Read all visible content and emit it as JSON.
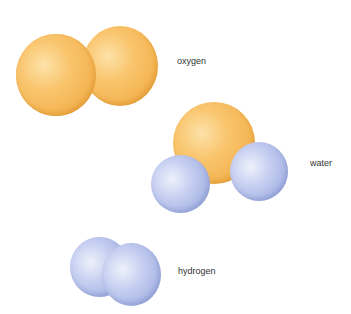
{
  "molecules": [
    {
      "name": "oxygen",
      "label": "oxygen",
      "atoms": [
        "O",
        "O"
      ]
    },
    {
      "name": "water",
      "label": "water",
      "atoms": [
        "O",
        "H",
        "H"
      ]
    },
    {
      "name": "hydrogen",
      "label": "hydrogen",
      "atoms": [
        "H",
        "H"
      ]
    }
  ],
  "colors": {
    "oxygen_atom": "#f6bc5e",
    "hydrogen_atom": "#b4c0ea",
    "text": "#333333"
  }
}
